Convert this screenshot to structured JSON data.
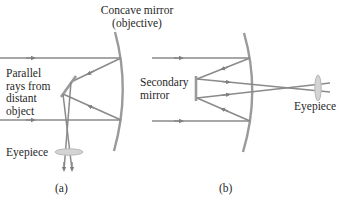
{
  "figure": {
    "panel_a": {
      "caption": "(a)",
      "mirror_label_line1": "Concave mirror",
      "mirror_label_line2": "(objective)",
      "rays_label": [
        "Parallel",
        "rays from",
        "distant",
        "object"
      ],
      "eyepiece_label": "Eyepiece"
    },
    "panel_b": {
      "caption": "(b)",
      "secondary_label": [
        "Secondary",
        "mirror"
      ],
      "eyepiece_label": "Eyepiece"
    },
    "colors": {
      "ray": "#8a8a8a",
      "mirror": "#9a9a9a",
      "lens": "#c4c4c4",
      "text": "#1f1f1f"
    }
  }
}
